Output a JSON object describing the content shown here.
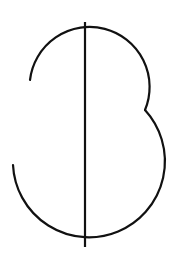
{
  "figure": {
    "background_color": "#ffffff",
    "stroke_color": "#111111",
    "stroke_width": 2.2,
    "vertical_line": {
      "x": 85,
      "y1": 22,
      "y2": 247
    },
    "top_arc": {
      "start": [
        30,
        80
      ],
      "center": [
        90,
        80
      ],
      "radius": 60,
      "end": [
        145,
        110
      ]
    },
    "bottom_arc": {
      "start": [
        145,
        110
      ],
      "center": [
        90,
        172
      ],
      "radius": 76,
      "end": [
        13,
        165
      ]
    }
  }
}
